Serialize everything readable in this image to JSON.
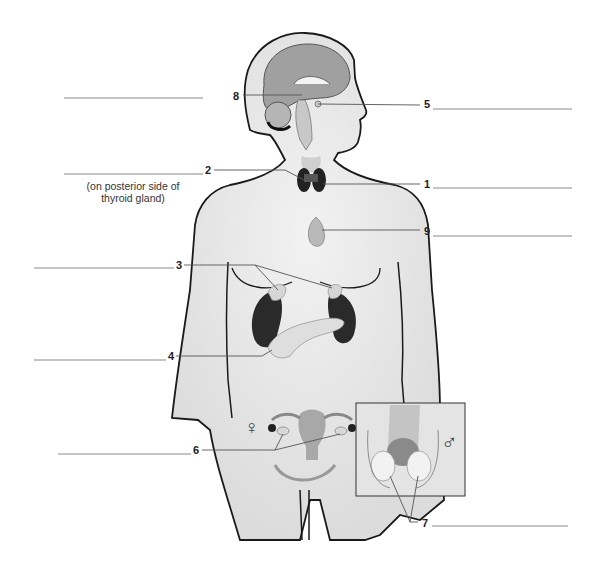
{
  "diagram": {
    "labels": [
      {
        "id": "8",
        "text": "8",
        "x": 233,
        "y": 92,
        "target": "pineal-gland-region",
        "answer_line": "left"
      },
      {
        "id": "5",
        "text": "5",
        "x": 424,
        "y": 102,
        "target": "pituitary-region",
        "answer_line": "right"
      },
      {
        "id": "2",
        "text": "2",
        "x": 205,
        "y": 166,
        "target": "parathyroid-glands",
        "answer_line": "left",
        "note": "(on posterior side of thyroid gland)"
      },
      {
        "id": "1",
        "text": "1",
        "x": 424,
        "y": 180,
        "target": "thyroid-gland",
        "answer_line": "right"
      },
      {
        "id": "9",
        "text": "9",
        "x": 424,
        "y": 226,
        "target": "thymus",
        "answer_line": "right"
      },
      {
        "id": "3",
        "text": "3",
        "x": 176,
        "y": 261,
        "target": "adrenal-glands",
        "answer_line": "left"
      },
      {
        "id": "4",
        "text": "4",
        "x": 168,
        "y": 352,
        "target": "pancreas",
        "answer_line": "left"
      },
      {
        "id": "6",
        "text": "6",
        "x": 193,
        "y": 446,
        "target": "ovaries",
        "answer_line": "left"
      },
      {
        "id": "7",
        "text": "7",
        "x": 422,
        "y": 519,
        "target": "testes",
        "answer_line": "right"
      }
    ],
    "note_text": "(on posterior side of thyroid gland)",
    "note_line1": "(on posterior side of",
    "note_line2": "thyroid gland)",
    "female_symbol": "♀",
    "male_symbol": "♂",
    "colors": {
      "body_fill": "#e8e8e8",
      "body_outline": "#1a1a1a",
      "brain": "#9a9a9a",
      "kidney": "#2a2a2a",
      "gland_light": "#d8d8d8",
      "leader_line": "#555555",
      "answer_line": "#888888"
    }
  }
}
